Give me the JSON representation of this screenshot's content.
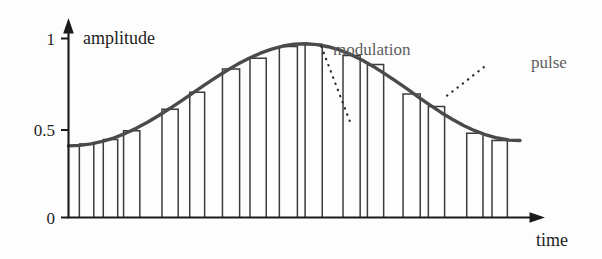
{
  "figure": {
    "title": "",
    "background_color": "#fdfdfd",
    "curve_color": "#4a4a4a",
    "bar_color": "#3b3b3b",
    "axis_color": "#1a1a1a",
    "annotation_color": "#5d5d5d"
  },
  "chart_data": {
    "type": "line",
    "title": "",
    "xlabel": "time",
    "ylabel": "amplitude",
    "xlim": [
      0,
      1
    ],
    "ylim": [
      0,
      1.06
    ],
    "grid": false,
    "legend": "none",
    "y_ticks": [
      0,
      0.5,
      1
    ],
    "y_tick_labels": [
      "0",
      "0.5",
      "1"
    ],
    "x_ticks": [],
    "x_tick_labels": [],
    "series": [
      {
        "name": "modulation",
        "type": "line",
        "x": [
          0.0,
          0.025,
          0.05,
          0.075,
          0.1,
          0.125,
          0.15,
          0.175,
          0.2,
          0.225,
          0.25,
          0.275,
          0.3,
          0.325,
          0.35,
          0.375,
          0.4,
          0.425,
          0.45,
          0.475,
          0.5,
          0.525,
          0.55,
          0.575,
          0.6,
          0.625,
          0.65,
          0.675,
          0.7,
          0.725,
          0.75,
          0.775,
          0.8,
          0.825,
          0.85,
          0.875,
          0.9,
          0.925,
          0.95,
          0.975,
          1.0
        ],
        "y": [
          0.4,
          0.403,
          0.411,
          0.425,
          0.444,
          0.469,
          0.498,
          0.532,
          0.57,
          0.61,
          0.652,
          0.695,
          0.738,
          0.78,
          0.82,
          0.857,
          0.89,
          0.918,
          0.941,
          0.958,
          0.968,
          0.971,
          0.966,
          0.954,
          0.936,
          0.911,
          0.88,
          0.844,
          0.804,
          0.762,
          0.718,
          0.673,
          0.629,
          0.587,
          0.549,
          0.514,
          0.485,
          0.461,
          0.444,
          0.433,
          0.43
        ]
      },
      {
        "name": "pulse",
        "type": "bar",
        "note": "rectangular pulses sampling the modulation envelope",
        "values": [
          {
            "center": 0.04,
            "width": 0.032,
            "height": 0.41
          },
          {
            "center": 0.093,
            "width": 0.032,
            "height": 0.436
          },
          {
            "center": 0.14,
            "width": 0.036,
            "height": 0.485
          },
          {
            "center": 0.225,
            "width": 0.036,
            "height": 0.605
          },
          {
            "center": 0.285,
            "width": 0.033,
            "height": 0.7
          },
          {
            "center": 0.36,
            "width": 0.038,
            "height": 0.83
          },
          {
            "center": 0.42,
            "width": 0.036,
            "height": 0.89
          },
          {
            "center": 0.487,
            "width": 0.04,
            "height": 0.955
          },
          {
            "center": 0.543,
            "width": 0.038,
            "height": 0.968
          },
          {
            "center": 0.627,
            "width": 0.038,
            "height": 0.905
          },
          {
            "center": 0.68,
            "width": 0.036,
            "height": 0.855
          },
          {
            "center": 0.76,
            "width": 0.038,
            "height": 0.69
          },
          {
            "center": 0.815,
            "width": 0.036,
            "height": 0.62
          },
          {
            "center": 0.9,
            "width": 0.036,
            "height": 0.47
          },
          {
            "center": 0.955,
            "width": 0.034,
            "height": 0.43
          }
        ]
      }
    ],
    "annotations": [
      {
        "name": "modulation",
        "text": "modulation",
        "label_x": 0.545,
        "label_y": 1.02,
        "leader_from": [
          0.56,
          0.955
        ],
        "leader_to": [
          0.625,
          0.525
        ],
        "leader_style": "dotted"
      },
      {
        "name": "pulse",
        "text": "pulse",
        "label_x": 0.88,
        "label_y": 0.93,
        "leader_from": [
          0.92,
          0.84
        ],
        "leader_to": [
          0.828,
          0.66
        ],
        "leader_style": "dotted"
      }
    ]
  },
  "labels": {
    "y_axis": "amplitude",
    "x_axis": "time",
    "y_tick_1": "1",
    "y_tick_05": "0.5",
    "y_tick_0": "0",
    "annotation_modulation": "modulation",
    "annotation_pulse": "pulse"
  }
}
